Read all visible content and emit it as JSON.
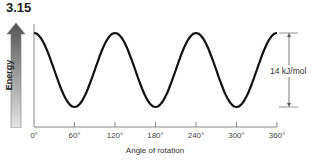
{
  "figure": {
    "number": "3.15"
  },
  "chart_data": {
    "type": "line",
    "title": "",
    "xlabel": "Angle of rotation",
    "ylabel": "Energy",
    "x_ticks": [
      "0°",
      "60°",
      "120°",
      "180°",
      "240°",
      "300°",
      "360°"
    ],
    "x": [
      0,
      60,
      120,
      180,
      240,
      300,
      360
    ],
    "series": [
      {
        "name": "Energy",
        "values": [
          14,
          0,
          14,
          0,
          14,
          0,
          14
        ],
        "shape": "cosine"
      }
    ],
    "xlim": [
      0,
      360
    ],
    "ylim": [
      0,
      14
    ],
    "grid": false,
    "annotations": [
      {
        "text": "14 kJ/mol",
        "type": "double-arrow",
        "meaning": "energy difference between maxima and minima"
      }
    ]
  },
  "labels": {
    "ylabel": "Energy",
    "xlabel": "Angle of rotation",
    "barrier": "14 kJ/mol",
    "ticks": [
      "0°",
      "60°",
      "120°",
      "180°",
      "240°",
      "300°",
      "360°"
    ]
  }
}
